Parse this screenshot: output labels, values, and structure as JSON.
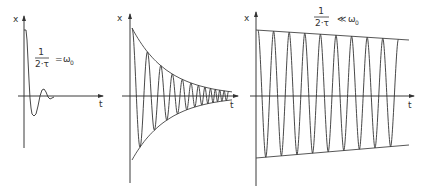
{
  "figure": {
    "background": "#ffffff",
    "stroke_color": "#333333",
    "panels": [
      {
        "id": "critical",
        "x_label": "x",
        "t_label": "t",
        "formula": {
          "numerator": "1",
          "denominator": "2·τ",
          "relation": "=",
          "rhs": "ω",
          "rhs_sub": "0"
        },
        "description": "aperiodic limit / heavily damped"
      },
      {
        "id": "damped",
        "x_label": "x",
        "t_label": "t",
        "description": "damped oscillation with exponential envelope"
      },
      {
        "id": "weakly-damped",
        "x_label": "x",
        "t_label": "t",
        "formula": {
          "numerator": "1",
          "denominator": "2·τ",
          "relation": "≪",
          "rhs": "ω",
          "rhs_sub": "0"
        },
        "description": "weakly damped oscillation with slowly decaying envelope"
      }
    ]
  },
  "chart_data": [
    {
      "type": "line",
      "title": "1/(2·τ) = ω0",
      "xlabel": "t",
      "ylabel": "x",
      "geometry": {
        "axis_x": 24,
        "axis_top": 16,
        "axis_bottom": 148,
        "zero_y": 96,
        "t_start": 18,
        "t_end": 103
      },
      "curve_points": [
        [
          24,
          30
        ],
        [
          26,
          30
        ],
        [
          27,
          40
        ],
        [
          28,
          60
        ],
        [
          29,
          80
        ],
        [
          30,
          98
        ],
        [
          31,
          108
        ],
        [
          32,
          114
        ],
        [
          34,
          116
        ],
        [
          36,
          114
        ],
        [
          38,
          106
        ],
        [
          40,
          96
        ],
        [
          42,
          90
        ],
        [
          44,
          89
        ],
        [
          46,
          92
        ],
        [
          48,
          97
        ],
        [
          50,
          99
        ],
        [
          52,
          98
        ],
        [
          54,
          97
        ]
      ]
    },
    {
      "type": "line",
      "title": "damped oscillation",
      "xlabel": "t",
      "ylabel": "x",
      "geometry": {
        "axis_x": 130,
        "axis_top": 14,
        "axis_bottom": 183,
        "zero_y": 96,
        "t_start": 122,
        "t_end": 238
      },
      "envelope": {
        "x_start": 132,
        "x_end": 232,
        "upper_start": 28,
        "lower_start": 160,
        "decay_rate": 0.028,
        "upper_end_extra_x": 134
      },
      "oscillation": {
        "x_start": 132,
        "x_end": 230,
        "first_half_period": 8,
        "period_shrink": 0.93
      }
    },
    {
      "type": "line",
      "title": "1/(2·τ) ≪ ω0",
      "xlabel": "t",
      "ylabel": "x",
      "geometry": {
        "axis_x": 256,
        "axis_top": 12,
        "axis_bottom": 186,
        "zero_y": 96,
        "t_start": 250,
        "t_end": 414
      },
      "envelope": {
        "x_start": 256,
        "x_end": 409,
        "upper_start": 30,
        "upper_end": 40,
        "lower_start": 158,
        "lower_end": 145
      },
      "oscillation": {
        "x_start": 258,
        "x_end": 405,
        "period": 15.6,
        "end_y": 40
      }
    }
  ]
}
